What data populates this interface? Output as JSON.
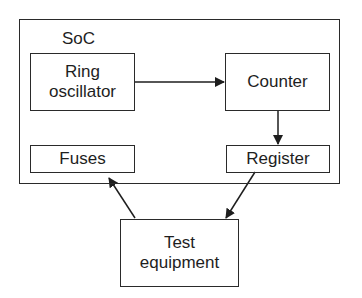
{
  "diagram": {
    "container": {
      "label": "SoC"
    },
    "blocks": {
      "ring_oscillator": "Ring\noscillator",
      "counter": "Counter",
      "fuses": "Fuses",
      "register": "Register",
      "test_equipment": "Test\nequipment"
    },
    "connections": [
      {
        "from": "Ring oscillator",
        "to": "Counter"
      },
      {
        "from": "Counter",
        "to": "Register"
      },
      {
        "from": "Register",
        "to": "Test equipment"
      },
      {
        "from": "Test equipment",
        "to": "Fuses"
      }
    ]
  }
}
